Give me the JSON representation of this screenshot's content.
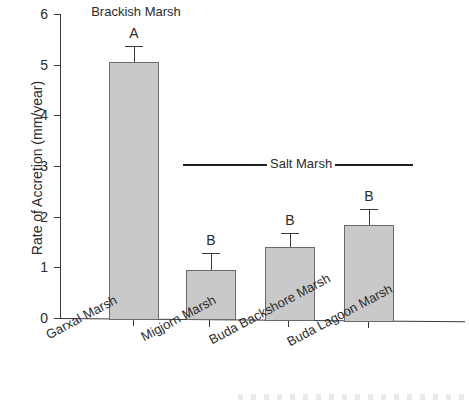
{
  "chart_data": {
    "type": "bar",
    "title": "",
    "xlabel": "",
    "ylabel": "Rate of Accretion (mm/year)",
    "ylim": [
      0,
      6
    ],
    "ytick_labels": [
      "0",
      "1",
      "2",
      "3",
      "4",
      "5",
      "6"
    ],
    "ytick_values": [
      0,
      1,
      2,
      3,
      4,
      5,
      6
    ],
    "grid": false,
    "legend_position": "none",
    "categories": [
      "Garxal Marsh",
      "Migjorn Marsh",
      "Buda Backshore Marsh",
      "Buda Lagoon Marsh"
    ],
    "values": [
      5.05,
      0.95,
      1.4,
      1.83
    ],
    "errors": [
      0.32,
      0.33,
      0.28,
      0.32
    ],
    "significance_letters": [
      "A",
      "B",
      "B",
      "B"
    ],
    "annotations": [
      {
        "name": "brackish-marsh-group",
        "text": "Brackish Marsh",
        "style": "plain-label",
        "covers": [
          "Garxal Marsh"
        ]
      },
      {
        "name": "salt-marsh-group",
        "text": "Salt Marsh",
        "style": "bracket-line",
        "covers": [
          "Migjorn Marsh",
          "Buda Backshore Marsh",
          "Buda Lagoon Marsh"
        ]
      }
    ],
    "bar_fill_color": "#c9c9c9",
    "bar_edge_color": "#6a6a6a",
    "axis_color": "#3a3a3a"
  },
  "axis": {
    "y_title": "Rate of Accretion (mm/year)",
    "ticks": [
      {
        "label": "6",
        "value": 6
      },
      {
        "label": "5",
        "value": 5
      },
      {
        "label": "4",
        "value": 4
      },
      {
        "label": "3",
        "value": 3
      },
      {
        "label": "2",
        "value": 2
      },
      {
        "label": "1",
        "value": 1
      },
      {
        "label": "0",
        "value": 0
      }
    ]
  },
  "groups": {
    "brackish": "Brackish Marsh",
    "salt": "Salt Marsh"
  },
  "bars": [
    {
      "label": "Garxal Marsh",
      "value": 5.05,
      "error": 0.32,
      "letter": "A"
    },
    {
      "label": "Migjorn Marsh",
      "value": 0.95,
      "error": 0.33,
      "letter": "B"
    },
    {
      "label": "Buda Backshore Marsh",
      "value": 1.4,
      "error": 0.28,
      "letter": "B"
    },
    {
      "label": "Buda Lagoon Marsh",
      "value": 1.83,
      "error": 0.32,
      "letter": "B"
    }
  ]
}
